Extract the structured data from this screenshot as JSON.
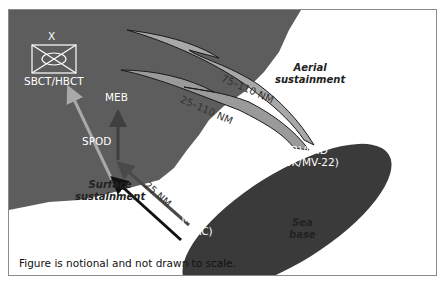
{
  "figure": {
    "caption": "Figure is notional and not drawn to scale.",
    "unit_symbol": {
      "echelon": "X",
      "label": "SBCT/HBCT"
    },
    "land_labels": {
      "meb": "MEB",
      "spod": "SPOD"
    },
    "sea_base": {
      "label_line1": "Sea",
      "label_line2": "base",
      "ship_line1": "LHA(R)/LHD",
      "ship_line2": "(CH-53K/MV-22)",
      "connector_line1": "MLPs",
      "connector_line2": "(LCAC)"
    },
    "aerial": {
      "title_line1": "Aerial",
      "title_line2": "sustainment",
      "range_outer": "75–110 NM",
      "range_inner": "25–110 NM"
    },
    "surface": {
      "title_line1": "Surface",
      "title_line2": "sustainment",
      "range": "25 NM"
    },
    "colors": {
      "land": "#5d5d5d",
      "sea_base": "#3a3a3a",
      "aerial_outer": "#a8a8a8",
      "aerial_inner": "#9a9a9a",
      "arrow_light": "#a9a9a9",
      "arrow_mid": "#4a4a4a",
      "arrow_dark": "#111111"
    }
  }
}
